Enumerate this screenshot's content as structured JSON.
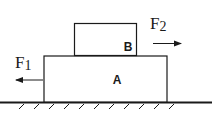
{
  "diagram": {
    "block_a_label": "A",
    "block_b_label": "B",
    "force_1": {
      "symbol": "F",
      "subscript": "1",
      "direction": "left"
    },
    "force_2": {
      "symbol": "F",
      "subscript": "2",
      "direction": "right"
    },
    "stroke_color": "#1a1a1a"
  }
}
